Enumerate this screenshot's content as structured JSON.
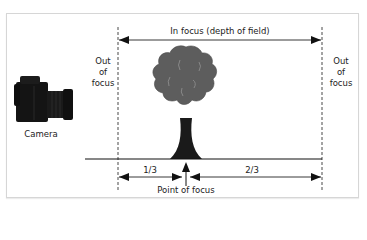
{
  "diagram": {
    "title_arrow_label": "In focus (depth of field)",
    "left_zone_label": [
      "Out",
      "of",
      "focus"
    ],
    "right_zone_label": [
      "Out",
      "of",
      "focus"
    ],
    "camera_label": "Camera",
    "near_fraction_label": "1/3",
    "far_fraction_label": "2/3",
    "focus_point_label": "Point of focus",
    "icons": {
      "camera": "camera-icon",
      "tree": "tree-icon"
    },
    "colors": {
      "frame_border": "#d6d6d6",
      "line": "#111111",
      "tree_canopy": "#5a5a5a",
      "tree_trunk": "#1a1a1a",
      "camera_body": "#141414",
      "text": "#222222"
    }
  }
}
